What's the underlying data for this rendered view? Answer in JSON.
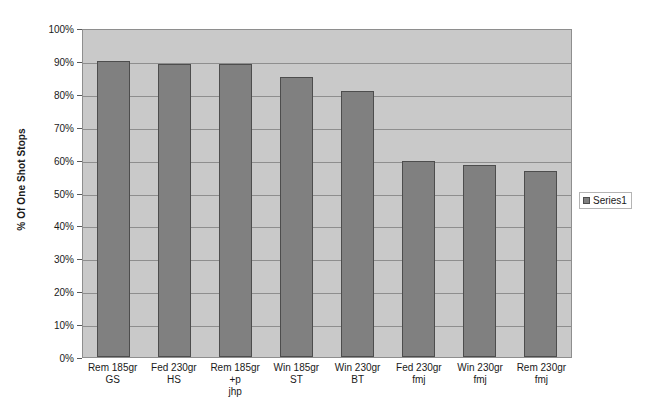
{
  "chart_data": {
    "type": "bar",
    "title": "",
    "xlabel": "",
    "ylabel": "% Of One Shot Stops",
    "ylim": [
      0,
      100
    ],
    "grid": true,
    "legend_position": "right",
    "categories": [
      "Rem 185gr GS",
      "Fed 230gr HS",
      "Rem 185gr +p jhp",
      "Win 185gr ST",
      "Win 230gr BT",
      "Fed 230gr fmj",
      "Win 230gr fmj",
      "Rem 230gr fmj"
    ],
    "category_lines": [
      [
        "Rem 185gr GS"
      ],
      [
        "Fed 230gr HS"
      ],
      [
        "Rem 185gr +p",
        "jhp"
      ],
      [
        "Win 185gr ST"
      ],
      [
        "Win 230gr BT"
      ],
      [
        "Fed 230gr fmj"
      ],
      [
        "Win 230gr fmj"
      ],
      [
        "Rem 230gr fmj"
      ]
    ],
    "series": [
      {
        "name": "Series1",
        "values": [
          90,
          89,
          89,
          85,
          81,
          59.5,
          58.5,
          56.5
        ]
      }
    ],
    "ytick_labels": [
      "100%",
      "90%",
      "80%",
      "70%",
      "60%",
      "50%",
      "40%",
      "30%",
      "20%",
      "10%",
      "0%"
    ],
    "ytick_values": [
      100,
      90,
      80,
      70,
      60,
      50,
      40,
      30,
      20,
      10,
      0
    ],
    "colors": {
      "bar_fill": "#808080",
      "bar_border": "#4d4d4d",
      "plot_background": "#c9c9c9",
      "gridline": "#8e8e8e",
      "text": "#1a1a1a",
      "page_background": "#ffffff"
    }
  },
  "legend": {
    "entries": [
      {
        "label": "Series1"
      }
    ]
  }
}
